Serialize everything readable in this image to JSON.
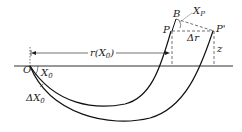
{
  "diagram": {
    "type": "ray-path geometry",
    "colors": {
      "line": "#1a1a1a",
      "dashed": "#333333",
      "background": "#ffffff"
    },
    "labels": {
      "origin": "O",
      "takeoff_angle": "X",
      "takeoff_angle_sub": "0",
      "delta_angle": "ΔX",
      "delta_angle_sub": "0",
      "distance": "r(X",
      "distance_sub": "0",
      "distance_close": ")",
      "point_b": "B",
      "point_p": "P",
      "point_p_prime": "P'",
      "angle_p": "X",
      "angle_p_sub": "P",
      "delta_r": "Δr",
      "depth": "z"
    }
  }
}
